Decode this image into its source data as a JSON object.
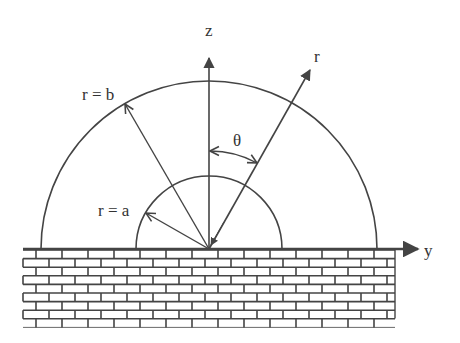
{
  "diagram": {
    "colors": {
      "line": "#444444",
      "text": "#333333",
      "background": "#ffffff",
      "brick_fill": "#ffffff"
    },
    "geometry": {
      "origin": [
        209,
        249
      ],
      "outer_radius_b": 168,
      "inner_radius_a": 73,
      "theta_deg": 30
    },
    "labels": {
      "z_axis": "z",
      "y_axis": "y",
      "r_axis": "r",
      "outer_radius": "r = b",
      "inner_radius": "r = a",
      "angle": "θ"
    },
    "wall": {
      "x": 23,
      "y": 250,
      "width": 372,
      "height": 77,
      "row_height": 8.6,
      "brick_width": 26
    }
  }
}
